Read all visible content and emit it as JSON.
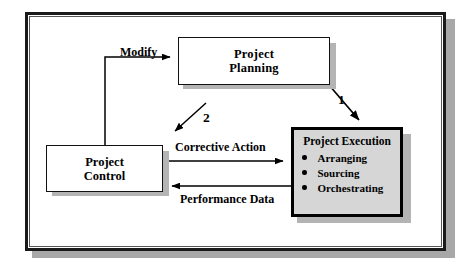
{
  "diagram": {
    "nodes": {
      "planning": {
        "name": "Project Planning",
        "line1": "Project",
        "line2": "Planning",
        "fill": "#ffffff",
        "border": "#111111"
      },
      "control": {
        "name": "Project Control",
        "line1": "Project",
        "line2": "Control",
        "fill": "#ffffff",
        "border": "#111111"
      },
      "execution": {
        "name": "Project Execution",
        "title": "Project Execution",
        "fill": "#d6d6d6",
        "border": "#000000",
        "items": [
          "Arranging",
          "Sourcing",
          "Orchestrating"
        ]
      }
    },
    "edges": {
      "modify": "Modify",
      "step_one": "1",
      "step_two": "2",
      "corrective_action": "Corrective Action",
      "performance_data": "Performance Data"
    },
    "colors": {
      "frame_border": "#1a1a1a",
      "shadow": "#b4b4b4",
      "frame_shadow": "#a8a8a8",
      "arrow": "#000000",
      "text": "#000000"
    }
  }
}
